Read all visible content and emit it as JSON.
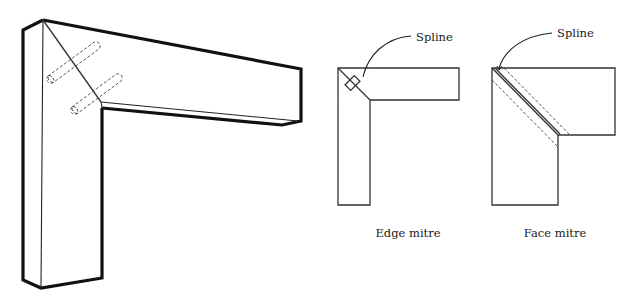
{
  "figure": {
    "isometric": {
      "name": "Dowelled mitre joint",
      "dowel_count": 2
    },
    "edge_mitre": {
      "caption": "Edge mitre",
      "callout": "Spline"
    },
    "face_mitre": {
      "caption": "Face mitre",
      "callout": "Spline"
    }
  },
  "colors": {
    "stroke": "#111111",
    "background": "#ffffff"
  }
}
